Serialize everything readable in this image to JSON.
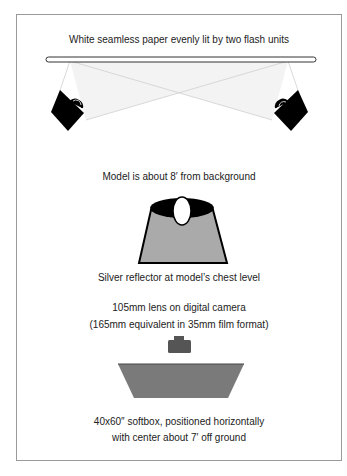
{
  "labels": {
    "background": "White seamless paper evenly lit by two flash units",
    "model": "Model is about 8′ from background",
    "reflector": "Silver reflector at model’s chest level",
    "lens_line1": "105mm lens on digital camera",
    "lens_line2": "(165mm equivalent in 35mm film format)",
    "softbox_line1": "40x60″ softbox, positioned horizontally",
    "softbox_line2": "with center about 7′ off ground"
  },
  "colors": {
    "frame": "#9a9a9a",
    "flash": "#000000",
    "light_beam": "#f2f2f2",
    "model_body": "#aaaaaa",
    "camera": "#555555",
    "softbox": "#777777"
  }
}
